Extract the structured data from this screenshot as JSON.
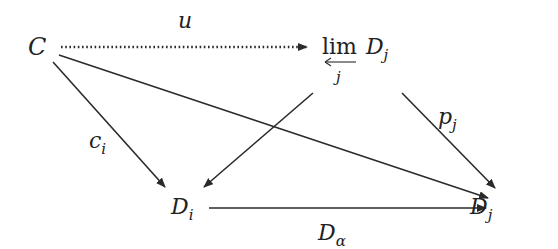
{
  "diagram": {
    "type": "commutative-diagram",
    "nodes": {
      "C": {
        "label": "C"
      },
      "lim": {
        "op": "lim",
        "op_subscript": "j",
        "object": "D",
        "object_subscript": "j"
      },
      "Di": {
        "label": "D",
        "subscript": "i"
      },
      "Dj": {
        "label": "D",
        "subscript": "j"
      }
    },
    "edges": [
      {
        "from": "C",
        "to": "lim",
        "label": "u",
        "style": "dotted"
      },
      {
        "from": "C",
        "to": "Di",
        "label_main": "c",
        "label_sub": "i",
        "style": "solid"
      },
      {
        "from": "C",
        "to": "Dj",
        "label": "",
        "style": "solid"
      },
      {
        "from": "lim",
        "to": "Di",
        "label": "",
        "style": "solid"
      },
      {
        "from": "lim",
        "to": "Dj",
        "label_main": "p",
        "label_sub": "j",
        "style": "solid"
      },
      {
        "from": "Di",
        "to": "Dj",
        "label_main": "D",
        "label_sub": "α",
        "style": "solid"
      }
    ],
    "colors": {
      "stroke": "#2a2a2a",
      "text": "#222222",
      "background": "#ffffff"
    }
  }
}
